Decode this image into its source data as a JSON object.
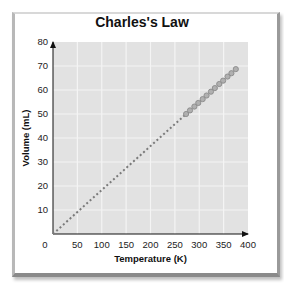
{
  "chart_data": {
    "type": "line",
    "title": "Charles's Law",
    "xlabel": "Temperature (K)",
    "ylabel": "Volume (mL)",
    "xlim": [
      0,
      400
    ],
    "ylim": [
      0,
      80
    ],
    "xticks": [
      0,
      50,
      100,
      150,
      200,
      250,
      300,
      350,
      400
    ],
    "yticks": [
      10,
      20,
      30,
      40,
      50,
      60,
      70,
      80
    ],
    "grid": true,
    "legend": null,
    "series": [
      {
        "name": "Extrapolated (dotted)",
        "style": "dotted",
        "x": [
          0,
          273
        ],
        "y": [
          0,
          50
        ]
      },
      {
        "name": "Measured",
        "style": "circles",
        "x": [
          273,
          281,
          290,
          298,
          307,
          315,
          324,
          332,
          341,
          349,
          358,
          366,
          375
        ],
        "y": [
          50.0,
          51.5,
          53.1,
          54.6,
          56.2,
          57.7,
          59.3,
          60.8,
          62.5,
          63.9,
          65.6,
          67.0,
          68.7
        ]
      }
    ]
  },
  "colors": {
    "plot_bg": "#e2e2e2",
    "grid": "#f4f4f4",
    "line": "#7a7a7a",
    "marker_fill": "#b0b0b0",
    "marker_stroke": "#8a8a8a"
  }
}
